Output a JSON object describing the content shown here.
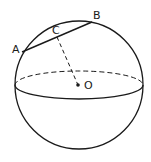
{
  "diagram": {
    "title": "",
    "labels": {
      "A": "A",
      "B": "B",
      "C": "C",
      "O": "O"
    },
    "colors": {
      "stroke": "#1a1a1a",
      "background": "#ffffff"
    },
    "geometry": {
      "sphere": {
        "cx": 79,
        "cy": 85,
        "r": 64
      },
      "equator": {
        "cx": 79,
        "cy": 85,
        "rx": 64,
        "ry": 14
      },
      "points": {
        "A": [
          22,
          52
        ],
        "B": [
          92,
          22
        ],
        "C": [
          57,
          37
        ],
        "O": [
          78,
          85
        ]
      },
      "segments": [
        {
          "from": "A",
          "to": "B",
          "style": "solid"
        },
        {
          "from": "C",
          "to": "O",
          "style": "dashed"
        }
      ]
    }
  }
}
